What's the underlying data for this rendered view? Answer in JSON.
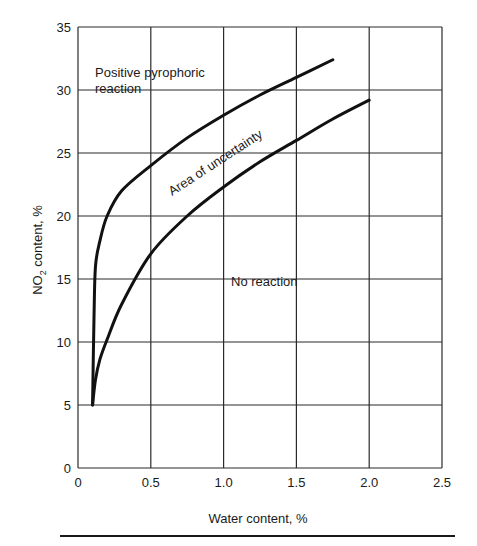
{
  "chart_data": {
    "type": "line",
    "title": "",
    "xlabel": "Water content, %",
    "ylabel": "NO2 content, %",
    "ylabel_main": "NO",
    "ylabel_sub": "2",
    "ylabel_rest": " content, %",
    "xlim": [
      0,
      2.5
    ],
    "ylim": [
      0,
      35
    ],
    "xticks": [
      "0",
      "0.5",
      "1.0",
      "1.5",
      "2.0",
      "2.5"
    ],
    "yticks": [
      "0",
      "5",
      "10",
      "15",
      "20",
      "25",
      "30",
      "35"
    ],
    "grid": true,
    "series": [
      {
        "name": "Upper boundary (positive pyrophoric reaction)",
        "x": [
          0.1,
          0.11,
          0.12,
          0.15,
          0.2,
          0.3,
          0.5,
          0.75,
          1.0,
          1.25,
          1.5,
          1.75
        ],
        "y": [
          5,
          12,
          16,
          18,
          20,
          22,
          24,
          26.2,
          28,
          29.6,
          31,
          32.4
        ]
      },
      {
        "name": "Lower boundary (no reaction)",
        "x": [
          0.1,
          0.12,
          0.15,
          0.2,
          0.3,
          0.5,
          0.75,
          1.0,
          1.25,
          1.5,
          1.75,
          2.0
        ],
        "y": [
          5,
          7,
          8.6,
          10.2,
          13,
          17,
          20,
          22.3,
          24.3,
          26,
          27.7,
          29.2
        ]
      }
    ],
    "annotations": [
      {
        "text_line1": "Positive pyrophoric",
        "text_line2": "reaction",
        "x": 0.1,
        "y": 31
      },
      {
        "text": "Area of uncertainty",
        "x": 0.6,
        "y": 21,
        "rotation": -33
      },
      {
        "text": "No reaction",
        "x": 1.05,
        "y": 14.2
      }
    ]
  }
}
